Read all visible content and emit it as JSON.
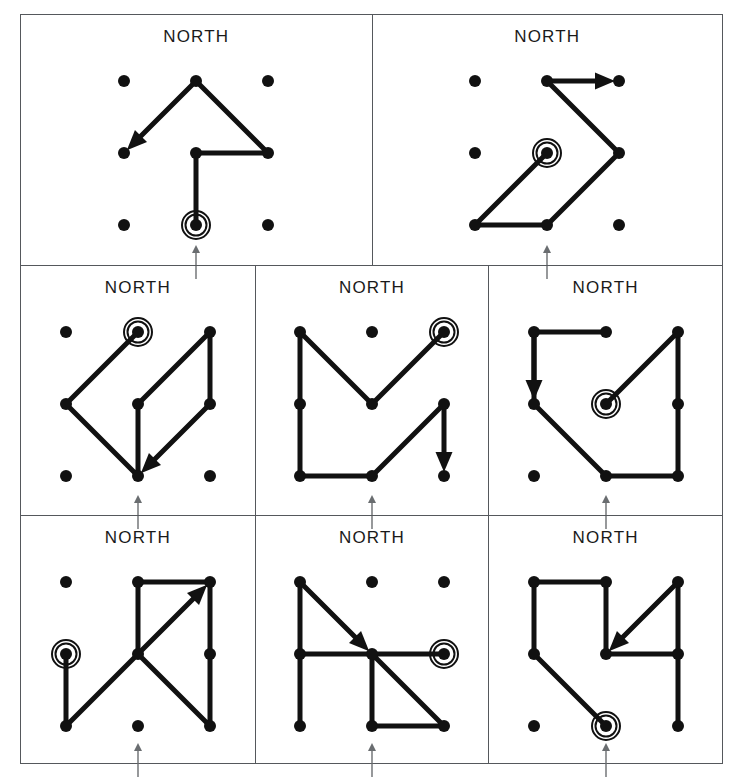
{
  "figure": {
    "panel_label": "NORTH",
    "grid": {
      "rows": 3,
      "cols": 3,
      "spacing": 72,
      "dot_radius": 6,
      "node_names": [
        "top-left",
        "top-center",
        "top-right",
        "left-middle",
        "center",
        "right-middle",
        "bottom-left",
        "bottom-center",
        "bottom-right"
      ]
    },
    "colors": {
      "ink": "#111111",
      "frame": "#55585c",
      "tick": "#6a6d70",
      "background": "#ffffff"
    },
    "line_width": 5,
    "start_marker": "circled-dot",
    "end_marker": "arrowhead",
    "below_panel_marker": "up-arrow-tick"
  },
  "panels": [
    {
      "id": "panel-1",
      "row": 1,
      "col": 1,
      "label": "NORTH",
      "start_node": "bottom-center",
      "path_nodes": [
        "bottom-center",
        "center",
        "right-middle",
        "top-center"
      ],
      "end_arrow": {
        "from_node": "top-center",
        "direction": "down-left",
        "tip_node": "left-middle"
      }
    },
    {
      "id": "panel-2",
      "row": 1,
      "col": 2,
      "label": "NORTH",
      "start_node": "center",
      "path_nodes": [
        "center",
        "bottom-left",
        "bottom-center",
        "right-middle",
        "top-center"
      ],
      "end_arrow": {
        "from_node": "top-center",
        "direction": "right",
        "tip_node": "top-right"
      }
    },
    {
      "id": "panel-3",
      "row": 2,
      "col": 1,
      "label": "NORTH",
      "start_node": "top-center",
      "path_nodes": [
        "top-center",
        "left-middle",
        "bottom-center",
        "center",
        "top-right",
        "right-middle"
      ],
      "end_arrow": {
        "from_node": "right-middle",
        "direction": "down-left",
        "tip_node": "bottom-center"
      }
    },
    {
      "id": "panel-4",
      "row": 2,
      "col": 2,
      "label": "NORTH",
      "start_node": "top-right",
      "path_nodes": [
        "top-right",
        "center",
        "top-left",
        "left-middle",
        "bottom-left",
        "bottom-center",
        "right-middle"
      ],
      "end_arrow": {
        "from_node": "right-middle",
        "direction": "down",
        "tip_node": "bottom-right"
      }
    },
    {
      "id": "panel-5",
      "row": 2,
      "col": 3,
      "label": "NORTH",
      "start_node": "center",
      "path_nodes": [
        "center",
        "top-right",
        "right-middle",
        "bottom-right",
        "bottom-center",
        "left-middle",
        "top-left",
        "top-center"
      ],
      "end_arrow": {
        "from_node": "top-left",
        "direction": "down",
        "tip_node": "left-middle"
      }
    },
    {
      "id": "panel-6",
      "row": 3,
      "col": 1,
      "label": "NORTH",
      "start_node": "left-middle",
      "path_nodes": [
        "left-middle",
        "bottom-left",
        "center",
        "bottom-right",
        "right-middle",
        "top-right",
        "top-center",
        "center"
      ],
      "end_arrow": {
        "from_node": "center",
        "direction": "up-right",
        "tip_node": "top-right"
      }
    },
    {
      "id": "panel-7",
      "row": 3,
      "col": 2,
      "label": "NORTH",
      "start_node": "right-middle",
      "path_nodes": [
        "right-middle",
        "center",
        "bottom-right",
        "bottom-center",
        "center",
        "left-middle",
        "bottom-left",
        "left-middle",
        "top-left"
      ],
      "end_arrow": {
        "from_node": "top-left",
        "direction": "down-right",
        "tip_node": "center"
      }
    },
    {
      "id": "panel-8",
      "row": 3,
      "col": 3,
      "label": "NORTH",
      "start_node": "bottom-center",
      "path_nodes": [
        "bottom-center",
        "left-middle",
        "top-left",
        "top-center",
        "center",
        "right-middle",
        "bottom-right",
        "right-middle",
        "top-right"
      ],
      "end_arrow": {
        "from_node": "top-right",
        "direction": "down-left",
        "tip_node": "center"
      }
    }
  ]
}
